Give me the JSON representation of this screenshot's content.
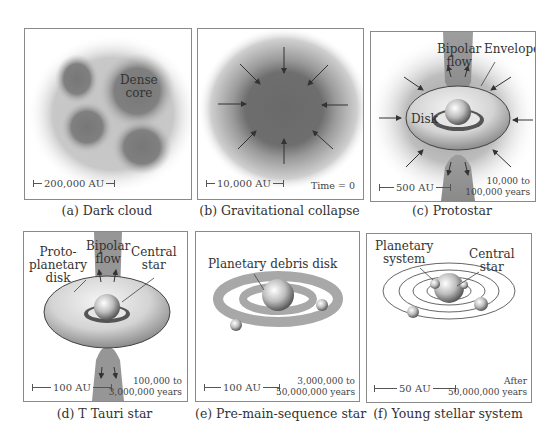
{
  "figure": {
    "panels": [
      {
        "id": "a",
        "caption": "(a) Dark cloud",
        "labels": {
          "core": "Dense core"
        },
        "core_lines": [
          "Dense",
          "core"
        ],
        "scale": "200,000 AU"
      },
      {
        "id": "b",
        "caption": "(b) Gravitational collapse",
        "scale": "10,000 AU",
        "time": "Time = 0"
      },
      {
        "id": "c",
        "caption": "(c) Protostar",
        "flow_lines": [
          "Bipolar",
          "flow"
        ],
        "envelope": "Envelope",
        "disk": "Disk",
        "scale": "500 AU",
        "time_lines": [
          "10,000 to",
          "100,000 years"
        ]
      },
      {
        "id": "d",
        "caption": "(d) T Tauri star",
        "disk_lines": [
          "Proto-",
          "planetary",
          "disk"
        ],
        "flow_lines": [
          "Bipolar",
          "flow"
        ],
        "star_lines": [
          "Central",
          "star"
        ],
        "scale": "100 AU",
        "time_lines": [
          "100,000 to",
          "3,000,000 years"
        ]
      },
      {
        "id": "e",
        "caption": "(e) Pre-main-sequence star",
        "debris": "Planetary debris disk",
        "scale": "100 AU",
        "time_lines": [
          "3,000,000 to",
          "50,000,000 years"
        ]
      },
      {
        "id": "f",
        "caption": "(f) Young stellar system",
        "system_lines": [
          "Planetary",
          "system"
        ],
        "star_lines": [
          "Central",
          "star"
        ],
        "scale": "50 AU",
        "time_lines": [
          "After",
          "50,000,000 years"
        ]
      }
    ]
  }
}
